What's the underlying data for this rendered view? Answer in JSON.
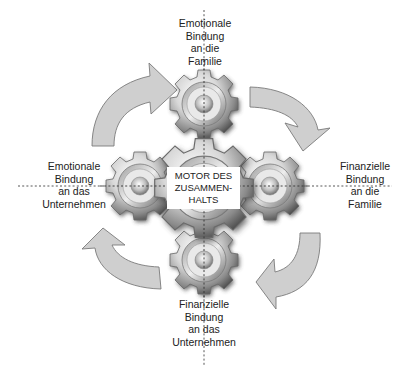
{
  "diagram": {
    "center": {
      "label": "MOTOR DES\nZUSAMMEN-\nHALTS"
    },
    "nodes": [
      {
        "id": "top",
        "label": "Emotionale\nBindung\nan die\nFamilie"
      },
      {
        "id": "right",
        "label": "Finanzielle\nBindung\nan die\nFamilie"
      },
      {
        "id": "bottom",
        "label": "Finanzielle\nBindung\nan das\nUnternehmen"
      },
      {
        "id": "left",
        "label": "Emotionale\nBindung\nan das\nUnternehmen"
      }
    ],
    "arrows": [
      {
        "from": "left",
        "to": "top",
        "direction": "clockwise"
      },
      {
        "from": "top",
        "to": "right",
        "direction": "clockwise"
      },
      {
        "from": "right",
        "to": "bottom",
        "direction": "clockwise"
      },
      {
        "from": "bottom",
        "to": "left",
        "direction": "clockwise"
      }
    ],
    "colors": {
      "arrow_fill": "#cfcfcf",
      "arrow_stroke": "#7a7a7a",
      "gear_light": "#f2f2f2",
      "gear_mid": "#b0b0b0",
      "gear_dark": "#555555",
      "axis_line": "#444444",
      "text": "#222222"
    }
  }
}
